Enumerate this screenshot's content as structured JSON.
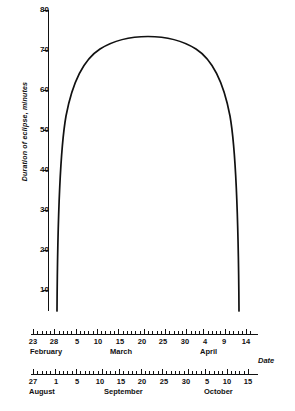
{
  "chart_data": {
    "type": "line",
    "title": "",
    "xlabel": "Date",
    "ylabel": "Duration of eclipse, minutes",
    "ylim": [
      0,
      80
    ],
    "grid": false,
    "legend": "none",
    "y_ticks": [
      80,
      70,
      60,
      50,
      40,
      30,
      20,
      10
    ],
    "x_axes": [
      {
        "name": "primary-date-axis",
        "months": [
          "February",
          "March",
          "April"
        ],
        "tick_labels": [
          "23",
          "28",
          "5",
          "10",
          "15",
          "20",
          "25",
          "30",
          "4",
          "9",
          "14"
        ],
        "range": [
          "February 22",
          "April 16"
        ]
      },
      {
        "name": "secondary-date-axis",
        "months": [
          "August",
          "September",
          "October"
        ],
        "tick_labels": [
          "27",
          "1",
          "5",
          "10",
          "15",
          "20",
          "25",
          "30",
          "5",
          "10",
          "15"
        ],
        "range": [
          "August 26",
          "October 18"
        ]
      }
    ],
    "series": [
      {
        "name": "Duration of eclipse",
        "x": [
          "Feb 28",
          "Mar 1",
          "Mar 3",
          "Mar 5",
          "Mar 7",
          "Mar 9",
          "Mar 11",
          "Mar 13",
          "Mar 15",
          "Mar 17",
          "Mar 19",
          "Mar 21",
          "Mar 23",
          "Mar 25",
          "Mar 27",
          "Mar 29",
          "Mar 31",
          "Apr 2",
          "Apr 4",
          "Apr 6",
          "Apr 8",
          "Apr 10",
          "Apr 11"
        ],
        "values": [
          5,
          26,
          40,
          49,
          56,
          61,
          65,
          68,
          70.5,
          72,
          72.8,
          73,
          72.7,
          71.8,
          70.3,
          68,
          65,
          61,
          56,
          49,
          40,
          24,
          5
        ]
      }
    ],
    "peak": {
      "value": 73,
      "date": "March 21"
    },
    "annotations": []
  },
  "axis_captions": {
    "date_label": "Date"
  }
}
